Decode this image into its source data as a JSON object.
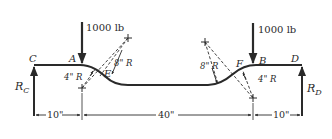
{
  "figure": {
    "type": "beam-loading-diagram",
    "colors": {
      "ink": "#2a2a2a",
      "background": "#ffffff"
    },
    "points": {
      "C": "C",
      "A": "A",
      "E": "E",
      "F": "F",
      "B": "B",
      "D": "D"
    },
    "loads": {
      "left": "1000 lb",
      "right": "1000 lb"
    },
    "reactions": {
      "left_main": "R",
      "left_sub": "C",
      "right_main": "R",
      "right_sub": "D"
    },
    "radii": {
      "left_small": "4\" R",
      "left_large": "8\" R",
      "right_large": "8\" R",
      "right_small": "4\" R"
    },
    "dimensions": {
      "left": "10\"",
      "middle": "40\"",
      "right": "10\""
    }
  }
}
